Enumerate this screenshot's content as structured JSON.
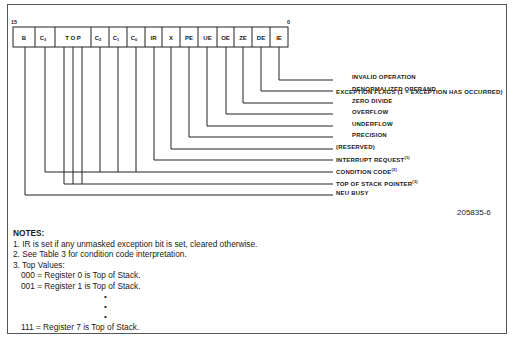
{
  "register": {
    "high_bit": "15",
    "low_bit": "0",
    "cells": [
      {
        "id": "B",
        "label": "B",
        "x1": 13,
        "x2": 35
      },
      {
        "id": "C3",
        "label": "C",
        "sub": "3",
        "x1": 35,
        "x2": 55
      },
      {
        "id": "TOP",
        "label": "T O P",
        "x1": 55,
        "x2": 91
      },
      {
        "id": "C2",
        "label": "C",
        "sub": "2",
        "x1": 91,
        "x2": 109
      },
      {
        "id": "C1",
        "label": "C",
        "sub": "1",
        "x1": 109,
        "x2": 127
      },
      {
        "id": "C0",
        "label": "C",
        "sub": "0",
        "x1": 127,
        "x2": 145
      },
      {
        "id": "IR",
        "label": "IR",
        "x1": 145,
        "x2": 162
      },
      {
        "id": "X",
        "label": "X",
        "x1": 162,
        "x2": 180
      },
      {
        "id": "PE",
        "label": "PE",
        "x1": 180,
        "x2": 198
      },
      {
        "id": "UE",
        "label": "UE",
        "x1": 198,
        "x2": 217
      },
      {
        "id": "OE",
        "label": "OE",
        "x1": 217,
        "x2": 234
      },
      {
        "id": "ZE",
        "label": "ZE",
        "x1": 234,
        "x2": 252
      },
      {
        "id": "DE",
        "label": "DE",
        "x1": 252,
        "x2": 270
      },
      {
        "id": "IE",
        "label": "IE",
        "x1": 270,
        "x2": 288
      }
    ]
  },
  "exception_flags_heading": "EXCEPTION FLAGS (1 = EXCEPTION HAS OCCURRED)",
  "flags": [
    {
      "label": "INVALID OPERATION",
      "sup": ""
    },
    {
      "label": "DENORMALIZED OPERAND",
      "sup": ""
    },
    {
      "label": "ZERO DIVIDE",
      "sup": ""
    },
    {
      "label": "OVERFLOW",
      "sup": ""
    },
    {
      "label": "UNDERFLOW",
      "sup": ""
    },
    {
      "label": "PRECISION",
      "sup": ""
    }
  ],
  "fields": [
    {
      "label": "(RESERVED)",
      "sup": ""
    },
    {
      "label": "INTERRUPT REQUEST",
      "sup": "(1)"
    },
    {
      "label": "CONDITION CODE",
      "sup": "(2)"
    },
    {
      "label": "TOP OF STACK POINTER",
      "sup": "(3)"
    },
    {
      "label": "NEU BUSY",
      "sup": ""
    }
  ],
  "figure_id": "205835-6",
  "notes": {
    "title": "NOTES:",
    "items": [
      "1. IR is set if any unmasked exception bit is set, cleared otherwise.",
      "2. See Table 3 for condition code interpretation.",
      "3. Top Values:"
    ],
    "top_values": [
      "000 = Register 0 is Top of Stack.",
      "001 = Register 1 is Top of Stack."
    ],
    "ellipsis": [
      "•",
      "•",
      "•"
    ],
    "last_value": "111 = Register 7 is Top of Stack."
  }
}
